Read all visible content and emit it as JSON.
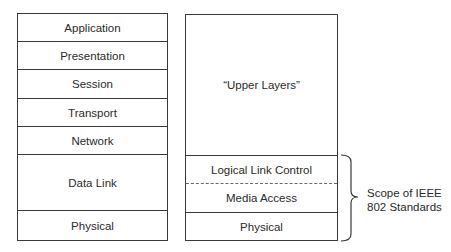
{
  "osi_stack": {
    "layers": [
      "Application",
      "Presentation",
      "Session",
      "Transport",
      "Network",
      "Data Link",
      "Physical"
    ]
  },
  "ieee_stack": {
    "upper": "“Upper Layers”",
    "llc": "Logical Link Control",
    "mac": "Media Access",
    "physical": "Physical"
  },
  "scope": {
    "line1": "Scope of IEEE",
    "line2": "802 Standards"
  }
}
